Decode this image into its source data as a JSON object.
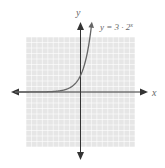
{
  "chart_data": {
    "type": "line",
    "title": "",
    "equation_label": "y = 3 · 2^x",
    "equation_text": "y = 3 · 2",
    "equation_exponent": "x",
    "xlabel": "x",
    "ylabel": "y",
    "xlim": [
      -10,
      10
    ],
    "ylim": [
      -10,
      10
    ],
    "grid": true,
    "grid_step": 1,
    "series": [
      {
        "name": "y = 3 · 2^x",
        "function": "3*2^x",
        "x": [
          -10,
          -6,
          -4,
          -3,
          -2,
          -1,
          0,
          1,
          1.5,
          2
        ],
        "y": [
          0.003,
          0.047,
          0.19,
          0.375,
          0.75,
          1.5,
          3,
          6,
          8.49,
          12
        ]
      }
    ],
    "colors": {
      "grid_background": "#e6e6e6",
      "grid_lines": "#ffffff",
      "axes": "#333333",
      "curve": "#666666"
    }
  }
}
